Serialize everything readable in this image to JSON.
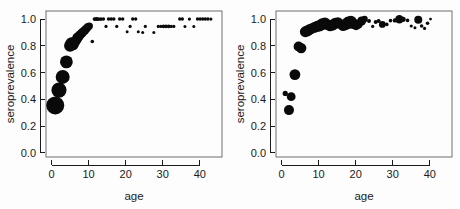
{
  "figure": {
    "name": "seroprevalence-by-age-two-panel-scatter",
    "background_color": "#fdfdfd",
    "point_color": "#0a0a0a",
    "frame_color": "#6f6f6f",
    "axis_color": "#1b1b1b",
    "panel_count": 2
  },
  "chart_data": [
    {
      "type": "scatter",
      "panel": "left",
      "title": "",
      "xlabel": "age",
      "ylabel": "seroprevalence",
      "xlim": [
        -1.5,
        46
      ],
      "ylim": [
        -0.03,
        1.06
      ],
      "xticks": [
        0,
        10,
        20,
        30,
        40
      ],
      "xticklabels": [
        "0",
        "10",
        "20",
        "30",
        "40"
      ],
      "yticks": [
        0.0,
        0.2,
        0.4,
        0.6,
        0.8,
        1.0
      ],
      "yticklabels": [
        "0.0",
        "0.2",
        "0.4",
        "0.6",
        "0.8",
        "1.0"
      ],
      "grid": false,
      "legend": false,
      "marker": "filled-circle",
      "size_encodes": "sample-size",
      "points": [
        {
          "x": 1.0,
          "y": 0.355,
          "s": 9.0
        },
        {
          "x": 2.0,
          "y": 0.47,
          "s": 7.6
        },
        {
          "x": 3.0,
          "y": 0.568,
          "s": 7.0
        },
        {
          "x": 4.0,
          "y": 0.68,
          "s": 6.4
        },
        {
          "x": 5.0,
          "y": 0.8,
          "s": 6.0
        },
        {
          "x": 5.4,
          "y": 0.818,
          "s": 6.2
        },
        {
          "x": 5.8,
          "y": 0.808,
          "s": 5.6
        },
        {
          "x": 6.2,
          "y": 0.828,
          "s": 5.4
        },
        {
          "x": 6.6,
          "y": 0.84,
          "s": 5.0
        },
        {
          "x": 7.0,
          "y": 0.86,
          "s": 5.2
        },
        {
          "x": 7.4,
          "y": 0.872,
          "s": 4.8
        },
        {
          "x": 7.8,
          "y": 0.884,
          "s": 4.6
        },
        {
          "x": 8.2,
          "y": 0.896,
          "s": 4.6
        },
        {
          "x": 8.6,
          "y": 0.905,
          "s": 4.4
        },
        {
          "x": 9.0,
          "y": 0.918,
          "s": 4.4
        },
        {
          "x": 9.4,
          "y": 0.928,
          "s": 4.2
        },
        {
          "x": 9.8,
          "y": 0.94,
          "s": 4.0
        },
        {
          "x": 10.2,
          "y": 0.948,
          "s": 3.6
        },
        {
          "x": 11.0,
          "y": 0.832,
          "s": 1.8
        },
        {
          "x": 11.6,
          "y": 1.0,
          "s": 1.9
        },
        {
          "x": 12.1,
          "y": 1.0,
          "s": 2.0
        },
        {
          "x": 12.6,
          "y": 1.0,
          "s": 1.9
        },
        {
          "x": 13.3,
          "y": 1.0,
          "s": 1.9
        },
        {
          "x": 14.0,
          "y": 1.0,
          "s": 1.7
        },
        {
          "x": 14.7,
          "y": 0.945,
          "s": 1.6
        },
        {
          "x": 15.4,
          "y": 1.0,
          "s": 1.8
        },
        {
          "x": 16.1,
          "y": 1.0,
          "s": 1.8
        },
        {
          "x": 16.8,
          "y": 1.0,
          "s": 1.7
        },
        {
          "x": 17.6,
          "y": 0.945,
          "s": 1.6
        },
        {
          "x": 18.4,
          "y": 1.0,
          "s": 1.8
        },
        {
          "x": 19.2,
          "y": 1.0,
          "s": 1.7
        },
        {
          "x": 20.4,
          "y": 0.905,
          "s": 1.5
        },
        {
          "x": 21.2,
          "y": 0.945,
          "s": 1.6
        },
        {
          "x": 21.9,
          "y": 1.0,
          "s": 1.7
        },
        {
          "x": 22.7,
          "y": 1.0,
          "s": 1.7
        },
        {
          "x": 23.4,
          "y": 0.905,
          "s": 1.5
        },
        {
          "x": 24.6,
          "y": 0.9,
          "s": 1.5
        },
        {
          "x": 25.3,
          "y": 0.945,
          "s": 1.6
        },
        {
          "x": 27.6,
          "y": 0.9,
          "s": 1.5
        },
        {
          "x": 28.8,
          "y": 0.945,
          "s": 1.6
        },
        {
          "x": 29.5,
          "y": 0.945,
          "s": 1.7
        },
        {
          "x": 30.2,
          "y": 0.945,
          "s": 1.8
        },
        {
          "x": 30.9,
          "y": 0.945,
          "s": 1.8
        },
        {
          "x": 31.6,
          "y": 0.945,
          "s": 1.8
        },
        {
          "x": 32.3,
          "y": 0.945,
          "s": 1.7
        },
        {
          "x": 33.0,
          "y": 0.945,
          "s": 1.6
        },
        {
          "x": 34.6,
          "y": 1.0,
          "s": 1.7
        },
        {
          "x": 35.3,
          "y": 1.0,
          "s": 1.7
        },
        {
          "x": 36.0,
          "y": 0.945,
          "s": 1.5
        },
        {
          "x": 37.2,
          "y": 1.0,
          "s": 1.6
        },
        {
          "x": 38.4,
          "y": 0.945,
          "s": 1.5
        },
        {
          "x": 39.4,
          "y": 1.0,
          "s": 1.7
        },
        {
          "x": 40.1,
          "y": 1.0,
          "s": 1.7
        },
        {
          "x": 40.8,
          "y": 1.0,
          "s": 1.7
        },
        {
          "x": 41.5,
          "y": 1.0,
          "s": 1.7
        },
        {
          "x": 42.2,
          "y": 1.0,
          "s": 1.7
        },
        {
          "x": 43.0,
          "y": 1.0,
          "s": 1.6
        }
      ]
    },
    {
      "type": "scatter",
      "panel": "right",
      "title": "",
      "xlabel": "age",
      "ylabel": "seroprevalence",
      "xlim": [
        -1.5,
        46
      ],
      "ylim": [
        -0.03,
        1.06
      ],
      "xticks": [
        0,
        10,
        20,
        30,
        40
      ],
      "xticklabels": [
        "0",
        "10",
        "20",
        "30",
        "40"
      ],
      "yticks": [
        0.0,
        0.2,
        0.4,
        0.6,
        0.8,
        1.0
      ],
      "yticklabels": [
        "0.0",
        "0.2",
        "0.4",
        "0.6",
        "0.8",
        "1.0"
      ],
      "grid": false,
      "legend": false,
      "marker": "filled-circle",
      "size_encodes": "sample-size",
      "points": [
        {
          "x": 1.0,
          "y": 0.445,
          "s": 2.6
        },
        {
          "x": 2.0,
          "y": 0.32,
          "s": 5.0
        },
        {
          "x": 2.6,
          "y": 0.42,
          "s": 4.4
        },
        {
          "x": 3.6,
          "y": 0.585,
          "s": 5.4
        },
        {
          "x": 4.6,
          "y": 0.795,
          "s": 5.0
        },
        {
          "x": 5.3,
          "y": 0.783,
          "s": 5.2
        },
        {
          "x": 6.4,
          "y": 0.905,
          "s": 5.4
        },
        {
          "x": 7.0,
          "y": 0.912,
          "s": 5.6
        },
        {
          "x": 7.6,
          "y": 0.922,
          "s": 5.4
        },
        {
          "x": 8.2,
          "y": 0.93,
          "s": 5.2
        },
        {
          "x": 8.9,
          "y": 0.938,
          "s": 5.4
        },
        {
          "x": 9.6,
          "y": 0.945,
          "s": 5.6
        },
        {
          "x": 10.3,
          "y": 0.95,
          "s": 5.8
        },
        {
          "x": 11.0,
          "y": 0.962,
          "s": 6.0
        },
        {
          "x": 11.7,
          "y": 0.97,
          "s": 5.6
        },
        {
          "x": 12.4,
          "y": 0.958,
          "s": 5.4
        },
        {
          "x": 13.1,
          "y": 0.948,
          "s": 5.2
        },
        {
          "x": 13.8,
          "y": 0.955,
          "s": 5.4
        },
        {
          "x": 14.5,
          "y": 0.968,
          "s": 5.6
        },
        {
          "x": 15.2,
          "y": 0.975,
          "s": 5.2
        },
        {
          "x": 15.9,
          "y": 0.962,
          "s": 5.0
        },
        {
          "x": 16.6,
          "y": 0.95,
          "s": 5.2
        },
        {
          "x": 17.3,
          "y": 0.958,
          "s": 5.6
        },
        {
          "x": 18.0,
          "y": 0.972,
          "s": 6.2
        },
        {
          "x": 18.7,
          "y": 0.98,
          "s": 6.0
        },
        {
          "x": 19.4,
          "y": 0.965,
          "s": 5.4
        },
        {
          "x": 20.1,
          "y": 0.952,
          "s": 4.8
        },
        {
          "x": 20.8,
          "y": 0.96,
          "s": 4.2
        },
        {
          "x": 21.6,
          "y": 0.985,
          "s": 4.6
        },
        {
          "x": 22.4,
          "y": 1.0,
          "s": 3.2
        },
        {
          "x": 23.6,
          "y": 0.985,
          "s": 2.0
        },
        {
          "x": 24.6,
          "y": 0.945,
          "s": 1.6
        },
        {
          "x": 25.4,
          "y": 0.978,
          "s": 2.0
        },
        {
          "x": 26.2,
          "y": 0.985,
          "s": 2.0
        },
        {
          "x": 27.2,
          "y": 0.96,
          "s": 3.4
        },
        {
          "x": 28.4,
          "y": 0.96,
          "s": 1.8
        },
        {
          "x": 29.4,
          "y": 0.988,
          "s": 1.8
        },
        {
          "x": 30.6,
          "y": 0.99,
          "s": 2.2
        },
        {
          "x": 31.8,
          "y": 0.998,
          "s": 4.2
        },
        {
          "x": 32.8,
          "y": 0.998,
          "s": 2.6
        },
        {
          "x": 34.0,
          "y": 0.99,
          "s": 1.8
        },
        {
          "x": 35.0,
          "y": 0.948,
          "s": 1.6
        },
        {
          "x": 36.0,
          "y": 0.935,
          "s": 1.5
        },
        {
          "x": 36.9,
          "y": 0.995,
          "s": 4.0
        },
        {
          "x": 37.8,
          "y": 0.948,
          "s": 1.8
        },
        {
          "x": 38.6,
          "y": 0.93,
          "s": 1.6
        },
        {
          "x": 39.4,
          "y": 0.968,
          "s": 1.8
        },
        {
          "x": 40.2,
          "y": 1.0,
          "s": 1.4
        }
      ]
    }
  ]
}
